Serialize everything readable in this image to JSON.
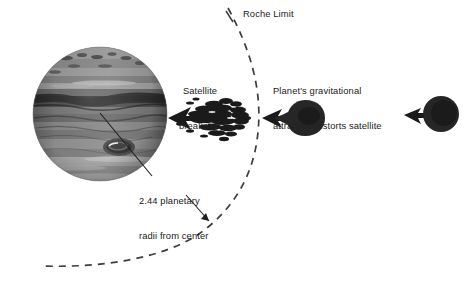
{
  "diagram": {
    "type": "astronomy-schematic",
    "background_color": "#ffffff",
    "text_color": "#222222",
    "labels": {
      "roche_limit": "Roche Limit",
      "satellite_breaks_up_line1": "Satellite",
      "satellite_breaks_up_line2": "breaks up",
      "planet_distorts_line1": "Planet's gravitational",
      "planet_distorts_line2": "attraction distorts satellite",
      "radii_line1": "2.44 planetary",
      "radii_line2": "radii from center"
    },
    "objects": {
      "planet": {
        "name": "banded gas giant planet",
        "center_x": 100,
        "center_y": 114,
        "radius": 67,
        "appearance": "grayscale horizontal cloud bands with dark oval storm spot",
        "storm_spot": {
          "center_x": 119,
          "center_y": 147,
          "rx": 15,
          "ry": 8
        }
      },
      "debris": {
        "name": "satellite debris stream",
        "center_x": 218,
        "center_y": 118,
        "description": "fragmented satellite breaking into a stream of rubble"
      },
      "distorted_satellite": {
        "name": "tidally distorted satellite",
        "center_x": 305,
        "center_y": 118,
        "rx": 18,
        "ry": 17,
        "description": "egg-shaped satellite stretched toward the planet"
      },
      "spherical_satellite": {
        "name": "undistorted spherical satellite",
        "center_x": 441,
        "center_y": 114,
        "rx": 17,
        "ry": 17,
        "description": "round satellite outside the Roche limit"
      }
    },
    "roche_limit_arc": {
      "style": "dashed",
      "color": "#3b3b3b",
      "description": "dashed arc marking the Roche limit at 2.44 planetary radii from center"
    },
    "arrows": [
      {
        "name": "debris-to-planet-arrow",
        "direction": "left",
        "from": "debris",
        "to": "planet"
      },
      {
        "name": "satellite-to-debris-arrow",
        "direction": "left",
        "from": "distorted satellite",
        "to": "debris"
      },
      {
        "name": "outer-satellite-arrow",
        "direction": "left",
        "from": "spherical satellite",
        "to": "inward"
      }
    ],
    "leader_lines": [
      {
        "name": "radii-leader-to-planet-center",
        "from_label": "2.44 planetary radii from center",
        "to": "planet center"
      },
      {
        "name": "radii-leader-to-arc",
        "from_label": "2.44 planetary radii from center",
        "to": "roche limit arc"
      },
      {
        "name": "roche-limit-leader",
        "from_label": "Roche Limit",
        "to": "roche limit arc"
      }
    ]
  }
}
